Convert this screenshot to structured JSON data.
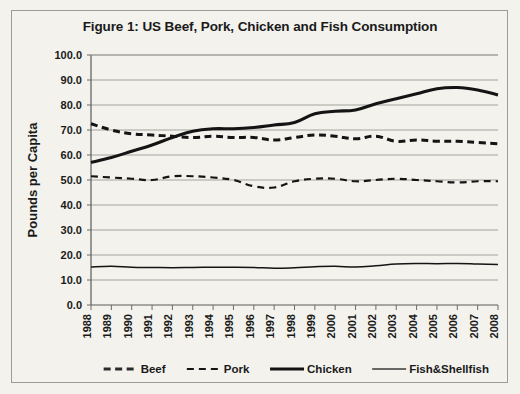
{
  "figure": {
    "title": "Figure 1: US Beef, Pork, Chicken and Fish Consumption",
    "ylabel": "Pounds per Capita"
  },
  "chart_data": {
    "type": "line",
    "title": "Figure 1: US Beef, Pork, Chicken and Fish Consumption",
    "xlabel": "",
    "ylabel": "Pounds per Capita",
    "ylim": [
      0.0,
      100.0
    ],
    "ytick_labels": [
      "100.0",
      "90.0",
      "80.0",
      "70.0",
      "60.0",
      "50.0",
      "40.0",
      "30.0",
      "20.0",
      "10.0",
      "0.0"
    ],
    "ytick_values": [
      100.0,
      90.0,
      80.0,
      70.0,
      60.0,
      50.0,
      40.0,
      30.0,
      20.0,
      10.0,
      0.0
    ],
    "grid": true,
    "legend_position": "bottom",
    "categories": [
      "1988",
      "1989",
      "1990",
      "1991",
      "1992",
      "1993",
      "1994",
      "1995",
      "1996",
      "1997",
      "1998",
      "1999",
      "2000",
      "2001",
      "2002",
      "2003",
      "2004",
      "2005",
      "2006",
      "2007",
      "2008"
    ],
    "series": [
      {
        "name": "Beef",
        "style": "thick-dashed",
        "color": "#141414",
        "values": [
          72.5,
          70.0,
          68.5,
          68.0,
          67.5,
          67.0,
          67.5,
          67.0,
          67.0,
          66.0,
          67.0,
          68.0,
          67.5,
          66.5,
          67.5,
          65.5,
          66.0,
          65.5,
          65.5,
          65.0,
          64.5
        ]
      },
      {
        "name": "Pork",
        "style": "thin-dashed",
        "color": "#141414",
        "values": [
          51.5,
          51.0,
          50.5,
          50.0,
          51.5,
          51.5,
          51.0,
          50.0,
          47.5,
          47.0,
          49.5,
          50.5,
          50.5,
          49.5,
          50.0,
          50.5,
          50.0,
          49.5,
          49.0,
          49.5,
          49.5
        ]
      },
      {
        "name": "Chicken",
        "style": "thick-solid",
        "color": "#141414",
        "values": [
          57.0,
          59.0,
          61.5,
          64.0,
          67.0,
          69.5,
          70.5,
          70.5,
          71.0,
          72.0,
          73.0,
          76.5,
          77.5,
          78.0,
          80.5,
          82.5,
          84.5,
          86.5,
          87.0,
          86.0,
          84.0
        ]
      },
      {
        "name": "Fish&Shellfish",
        "style": "thin-solid",
        "color": "#2a2a2a",
        "values": [
          15.2,
          15.5,
          15.1,
          15.0,
          14.9,
          15.0,
          15.1,
          15.1,
          15.0,
          14.7,
          14.9,
          15.3,
          15.5,
          15.2,
          15.7,
          16.4,
          16.6,
          16.5,
          16.6,
          16.4,
          16.2
        ]
      }
    ]
  },
  "legend": {
    "items": [
      {
        "label": "Beef",
        "style": "thick-dashed"
      },
      {
        "label": "Pork",
        "style": "thin-dashed"
      },
      {
        "label": "Chicken",
        "style": "thick-solid"
      },
      {
        "label": "Fish&Shellfish",
        "style": "thin-solid"
      }
    ]
  }
}
